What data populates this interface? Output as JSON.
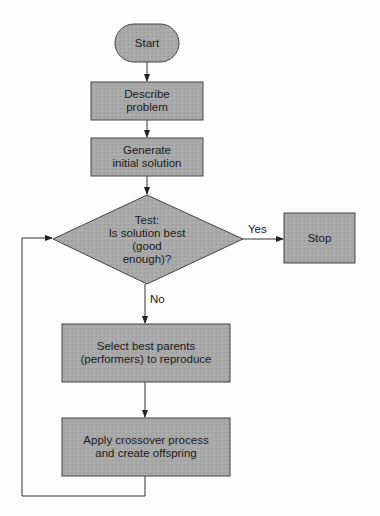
{
  "diagram": {
    "type": "flowchart",
    "colors": {
      "fill": "#a7a7a7",
      "stroke": "#444444",
      "line": "#333333",
      "background": "#fdfdfd"
    },
    "nodes": [
      {
        "id": "start",
        "shape": "terminator",
        "label": "Start"
      },
      {
        "id": "describe",
        "shape": "process",
        "label": "Describe problem"
      },
      {
        "id": "generate",
        "shape": "process",
        "label": "Generate initial solution"
      },
      {
        "id": "test",
        "shape": "decision",
        "label": "Test: Is solution best (good enough)?"
      },
      {
        "id": "stop",
        "shape": "process",
        "label": "Stop"
      },
      {
        "id": "select",
        "shape": "process",
        "label": "Select best parents (performers) to reproduce"
      },
      {
        "id": "apply",
        "shape": "process",
        "label": "Apply crossover process and create offspring"
      }
    ],
    "edges": [
      {
        "from": "start",
        "to": "describe",
        "label": ""
      },
      {
        "from": "describe",
        "to": "generate",
        "label": ""
      },
      {
        "from": "generate",
        "to": "test",
        "label": ""
      },
      {
        "from": "test",
        "to": "stop",
        "label": "Yes"
      },
      {
        "from": "test",
        "to": "select",
        "label": "No"
      },
      {
        "from": "select",
        "to": "apply",
        "label": ""
      },
      {
        "from": "apply",
        "to": "test",
        "label": ""
      }
    ]
  },
  "labels": {
    "start": "Start",
    "describe_1": "Describe",
    "describe_2": "problem",
    "generate_1": "Generate",
    "generate_2": "initial solution",
    "test_1": "Test:",
    "test_2": "Is solution best",
    "test_3": "(good",
    "test_4": "enough)?",
    "stop": "Stop",
    "select_1": "Select best parents",
    "select_2": "(performers) to reproduce",
    "apply_1": "Apply crossover process",
    "apply_2": "and create offspring",
    "yes": "Yes",
    "no": "No"
  }
}
